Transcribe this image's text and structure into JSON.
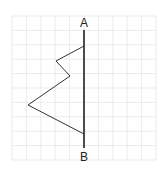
{
  "diagram": {
    "type": "symmetry-exercise",
    "grid": {
      "x0": 12,
      "y0": 16,
      "cols": 10,
      "rows": 10,
      "cell": 14.4,
      "color": "#ebebeb"
    },
    "axis": {
      "label_top": "A",
      "label_bottom": "B",
      "x": 84,
      "y1": 30,
      "y2": 148,
      "color": "#222222"
    },
    "shape": {
      "points": [
        [
          84,
          46
        ],
        [
          56,
          61
        ],
        [
          70,
          76
        ],
        [
          28,
          105
        ],
        [
          84,
          134
        ]
      ],
      "color": "#333333"
    }
  }
}
